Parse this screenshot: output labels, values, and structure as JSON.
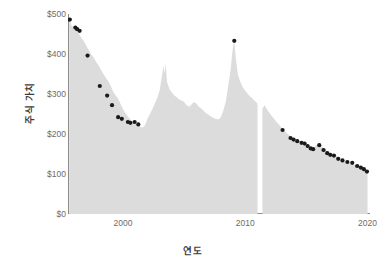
{
  "chart_data": {
    "type": "area",
    "title": "",
    "xlabel": "연도",
    "ylabel": "주식 가치",
    "xlim": [
      1995.5,
      2020.2
    ],
    "ylim": [
      0,
      500
    ],
    "grid": false,
    "legend": "none",
    "x_ticks": [
      {
        "value": 2000,
        "label": "2000"
      },
      {
        "value": 2010,
        "label": "2010"
      },
      {
        "value": 2020,
        "label": "2020"
      }
    ],
    "y_ticks": [
      {
        "value": 0,
        "label": "$0"
      },
      {
        "value": 100,
        "label": "$100"
      },
      {
        "value": 200,
        "label": "$200"
      },
      {
        "value": 300,
        "label": "$300"
      },
      {
        "value": 400,
        "label": "$400"
      },
      {
        "value": 500,
        "label": "$500"
      }
    ],
    "series": [
      {
        "name": "주식 가치",
        "type": "area",
        "color": "#dcdcdc",
        "x": [
          1995.6,
          1995.8,
          1996.0,
          1996.2,
          1996.4,
          1996.6,
          1996.8,
          1997.0,
          1997.2,
          1997.4,
          1997.6,
          1997.8,
          1998.0,
          1998.2,
          1998.4,
          1998.6,
          1998.8,
          1999.0,
          1999.2,
          1999.4,
          1999.6,
          1999.8,
          2000.0,
          2000.2,
          2000.4,
          2000.6,
          2000.8,
          2001.0,
          2001.2,
          2001.4,
          2001.6,
          2001.8,
          2002.0,
          2002.2,
          2002.4,
          2002.6,
          2002.8,
          2003.0,
          2003.2,
          2003.3,
          2003.4,
          2003.5,
          2003.6,
          2003.8,
          2004.0,
          2004.2,
          2004.4,
          2004.6,
          2004.8,
          2005.0,
          2005.2,
          2005.4,
          2005.6,
          2005.8,
          2006.0,
          2006.2,
          2006.4,
          2006.6,
          2006.8,
          2007.0,
          2007.2,
          2007.4,
          2007.6,
          2007.8,
          2008.0,
          2008.2,
          2008.4,
          2008.6,
          2008.8,
          2008.9,
          2009.0,
          2009.1,
          2009.2,
          2009.3,
          2009.4,
          2009.6,
          2009.8,
          2010.0,
          2010.2,
          2010.4,
          2010.6,
          2010.8,
          2011.0,
          2011.2,
          2011.4,
          2011.6,
          2011.8,
          2012.0,
          2012.2,
          2012.4,
          2012.6,
          2012.8,
          2013.0,
          2013.2,
          2013.4,
          2013.6,
          2013.8,
          2014.0,
          2014.2,
          2014.4,
          2014.6,
          2014.8,
          2015.0,
          2015.2,
          2015.4,
          2015.6,
          2015.8,
          2016.0,
          2016.2,
          2016.4,
          2016.6,
          2016.8,
          2017.0,
          2017.2,
          2017.4,
          2017.6,
          2017.8,
          2018.0,
          2018.2,
          2018.4,
          2018.6,
          2018.8,
          2019.0,
          2019.2,
          2019.4,
          2019.6,
          2019.8,
          2020.0
        ],
        "y": [
          487,
          470,
          466,
          462,
          450,
          440,
          432,
          420,
          410,
          398,
          392,
          380,
          372,
          360,
          350,
          340,
          332,
          320,
          305,
          296,
          288,
          275,
          262,
          252,
          244,
          236,
          230,
          226,
          222,
          218,
          216,
          222,
          238,
          250,
          262,
          276,
          290,
          310,
          348,
          372,
          352,
          376,
          330,
          312,
          304,
          296,
          292,
          286,
          284,
          280,
          272,
          268,
          274,
          280,
          276,
          268,
          264,
          258,
          252,
          248,
          244,
          240,
          238,
          236,
          242,
          258,
          280,
          320,
          360,
          392,
          420,
          432,
          398,
          370,
          348,
          330,
          316,
          308,
          300,
          294,
          288,
          282,
          276,
          270,
          264,
          272,
          260,
          252,
          244,
          236,
          228,
          222,
          214,
          208,
          202,
          196,
          190,
          184,
          180,
          176,
          174,
          170,
          168,
          164,
          162,
          166,
          172,
          176,
          170,
          164,
          160,
          156,
          152,
          148,
          146,
          142,
          138,
          134,
          130,
          128,
          126,
          124,
          122,
          120,
          118,
          114,
          110,
          106
        ],
        "data_gaps": [
          [
            2011.05,
            2011.25
          ]
        ]
      },
      {
        "name": "관측 지점",
        "type": "scatter",
        "color": "#1a1a1a",
        "points": [
          {
            "x": 1995.65,
            "y": 486
          },
          {
            "x": 1996.1,
            "y": 466
          },
          {
            "x": 1996.25,
            "y": 462
          },
          {
            "x": 1996.45,
            "y": 458
          },
          {
            "x": 1997.1,
            "y": 396
          },
          {
            "x": 1998.1,
            "y": 320
          },
          {
            "x": 1998.7,
            "y": 296
          },
          {
            "x": 1999.1,
            "y": 272
          },
          {
            "x": 1999.6,
            "y": 242
          },
          {
            "x": 1999.9,
            "y": 238
          },
          {
            "x": 2000.4,
            "y": 230
          },
          {
            "x": 2000.6,
            "y": 228
          },
          {
            "x": 2000.95,
            "y": 230
          },
          {
            "x": 2001.25,
            "y": 224
          },
          {
            "x": 2009.1,
            "y": 433
          },
          {
            "x": 2013.05,
            "y": 210
          },
          {
            "x": 2013.7,
            "y": 190
          },
          {
            "x": 2013.95,
            "y": 186
          },
          {
            "x": 2014.25,
            "y": 182
          },
          {
            "x": 2014.6,
            "y": 178
          },
          {
            "x": 2014.85,
            "y": 176
          },
          {
            "x": 2015.1,
            "y": 170
          },
          {
            "x": 2015.35,
            "y": 164
          },
          {
            "x": 2015.55,
            "y": 162
          },
          {
            "x": 2016.05,
            "y": 172
          },
          {
            "x": 2016.4,
            "y": 160
          },
          {
            "x": 2016.7,
            "y": 152
          },
          {
            "x": 2016.95,
            "y": 148
          },
          {
            "x": 2017.25,
            "y": 146
          },
          {
            "x": 2017.6,
            "y": 138
          },
          {
            "x": 2017.95,
            "y": 134
          },
          {
            "x": 2018.35,
            "y": 130
          },
          {
            "x": 2018.75,
            "y": 128
          },
          {
            "x": 2019.15,
            "y": 120
          },
          {
            "x": 2019.45,
            "y": 116
          },
          {
            "x": 2019.7,
            "y": 112
          },
          {
            "x": 2019.95,
            "y": 106
          }
        ]
      }
    ]
  }
}
